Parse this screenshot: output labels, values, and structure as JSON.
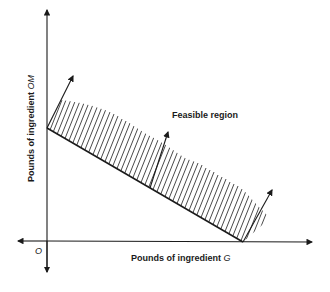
{
  "diagram": {
    "type": "linear-programming-feasible-region",
    "x_axis_label": "Pounds of ingredient ",
    "x_axis_var": "G",
    "y_axis_label": "Pounds of ingredient ",
    "y_axis_var": "OM",
    "origin_label": "O",
    "region_label": "Feasible region",
    "colors": {
      "ink": "#1a1a1a",
      "background": "#ffffff"
    }
  }
}
